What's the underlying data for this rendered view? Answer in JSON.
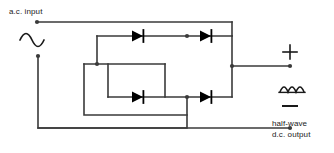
{
  "diagram": {
    "type": "circuit-schematic",
    "stroke_color": "#3a3a3a",
    "text_color": "#1a1a1a",
    "background_color": "#ffffff"
  },
  "input": {
    "label": "a.c. input",
    "waveform_icon": "ac-sine-wave-icon",
    "waveform_description": "full sine wave, one positive hump then one negative hump",
    "terminal_top": "input-terminal-top",
    "terminal_bottom": "input-terminal-bottom"
  },
  "output": {
    "polarity_positive": "+",
    "polarity_negative": "–",
    "waveform_icon": "rectified-wave-icon",
    "waveform_description": "three positive half-sine humps on a baseline",
    "label_line1": "half-wave",
    "label_line2": "d.c. output",
    "terminal_positive": "output-terminal-positive",
    "terminal_negative": "output-terminal-negative"
  },
  "components": {
    "diodes": [
      {
        "name": "diode-top-left",
        "direction": "right"
      },
      {
        "name": "diode-top-right",
        "direction": "right"
      },
      {
        "name": "diode-bottom-left",
        "direction": "right"
      },
      {
        "name": "diode-bottom-right",
        "direction": "right"
      }
    ],
    "junction_count": 4
  }
}
